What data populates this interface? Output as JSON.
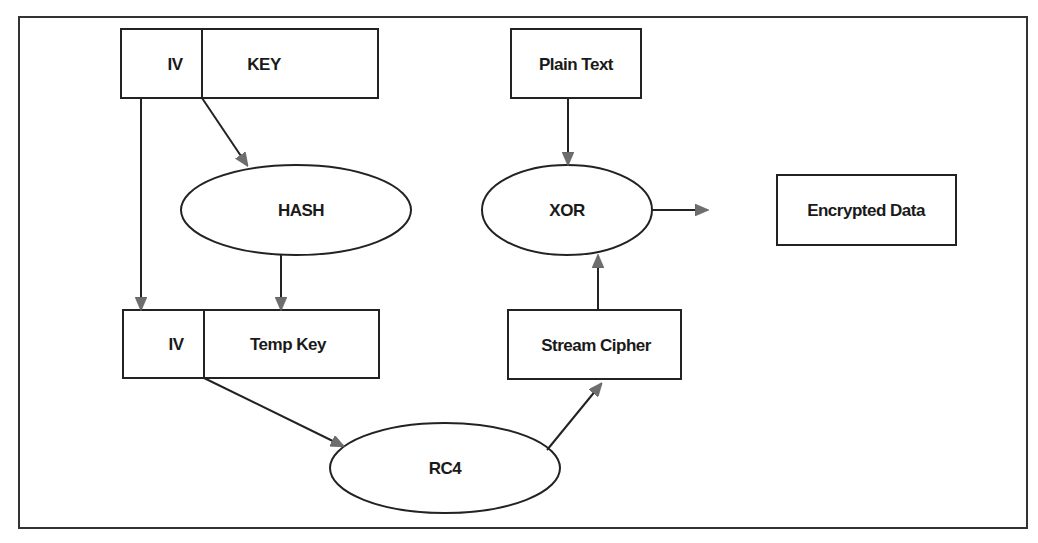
{
  "diagram": {
    "type": "flowchart",
    "nodes": {
      "iv_key_box": {
        "iv_label": "IV",
        "key_label": "KEY"
      },
      "hash": {
        "label": "HASH"
      },
      "iv_tempkey_box": {
        "iv_label": "IV",
        "tempkey_label": "Temp Key"
      },
      "rc4": {
        "label": "RC4"
      },
      "plain_text": {
        "label": "Plain Text"
      },
      "xor": {
        "label": "XOR"
      },
      "stream_cipher": {
        "label": "Stream Cipher"
      },
      "encrypted_data": {
        "label": "Encrypted Data"
      }
    },
    "edges": [
      {
        "from": "IV",
        "to": "IV (Temp Key box)"
      },
      {
        "from": "KEY",
        "to": "HASH"
      },
      {
        "from": "HASH",
        "to": "Temp Key"
      },
      {
        "from": "IV + Temp Key",
        "to": "RC4"
      },
      {
        "from": "RC4",
        "to": "Stream Cipher"
      },
      {
        "from": "Stream Cipher",
        "to": "XOR"
      },
      {
        "from": "Plain Text",
        "to": "XOR"
      },
      {
        "from": "XOR",
        "to": "Encrypted Data"
      }
    ],
    "colors": {
      "stroke": "#222222",
      "arrowhead": "#6e6e6e",
      "background": "#ffffff"
    }
  }
}
